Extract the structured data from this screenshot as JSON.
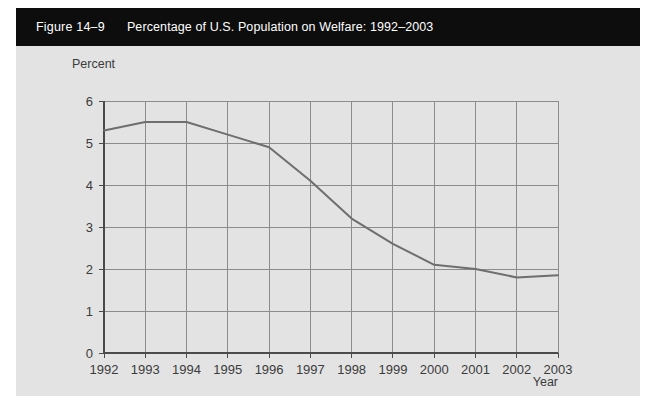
{
  "figure": {
    "number_label": "Figure 14–9",
    "title": "Percentage of U.S. Population on Welfare: 1992–2003",
    "header_background": "#0d0d0d",
    "panel_background": "#e3e3e3"
  },
  "chart_data": {
    "type": "line",
    "title": "Percentage of U.S. Population on Welfare: 1992–2003",
    "xlabel": "Year",
    "ylabel": "Percent",
    "categories": [
      "1992",
      "1993",
      "1994",
      "1995",
      "1996",
      "1997",
      "1998",
      "1999",
      "2000",
      "2001",
      "2002",
      "2003"
    ],
    "x": [
      1992,
      1993,
      1994,
      1995,
      1996,
      1997,
      1998,
      1999,
      2000,
      2001,
      2002,
      2003
    ],
    "values": [
      5.3,
      5.5,
      5.5,
      5.2,
      4.9,
      4.1,
      3.2,
      2.6,
      2.1,
      2.0,
      1.8,
      1.85
    ],
    "series": [
      {
        "name": "Percentage of U.S. Population on Welfare",
        "values": [
          5.3,
          5.5,
          5.5,
          5.2,
          4.9,
          4.1,
          3.2,
          2.6,
          2.1,
          2.0,
          1.8,
          1.85
        ],
        "color": "#6e6e6e"
      }
    ],
    "ylim": [
      0,
      6
    ],
    "yticks": [
      0,
      1,
      2,
      3,
      4,
      5,
      6
    ],
    "ytick_labels": [
      "0",
      "1",
      "2",
      "3",
      "4",
      "5",
      "6"
    ],
    "xticks": [
      1992,
      1993,
      1994,
      1995,
      1996,
      1997,
      1998,
      1999,
      2000,
      2001,
      2002,
      2003
    ],
    "xtick_labels": [
      "1992",
      "1993",
      "1994",
      "1995",
      "1996",
      "1997",
      "1998",
      "1999",
      "2000",
      "2001",
      "2002",
      "2003"
    ],
    "grid": true,
    "grid_color": "#8c8c8c",
    "legend": false,
    "legend_position": "none"
  }
}
